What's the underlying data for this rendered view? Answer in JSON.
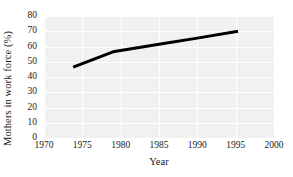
{
  "chart_data": {
    "type": "line",
    "title": "",
    "xlabel": "Year",
    "ylabel": "Mothers in work force (%)",
    "xlim": [
      1970,
      2000
    ],
    "ylim": [
      0,
      80
    ],
    "xticks": [
      1970,
      1975,
      1980,
      1985,
      1990,
      1995,
      2000
    ],
    "xtick_labels": [
      "1970",
      "1975",
      "1980",
      "1985",
      "1990",
      "1995",
      "2000"
    ],
    "yticks": [
      0,
      10,
      20,
      30,
      40,
      50,
      60,
      70,
      80
    ],
    "ytick_labels": [
      "0",
      "10",
      "20",
      "30",
      "40",
      "50",
      "60",
      "70",
      "80"
    ],
    "grid": true,
    "grid_color": "#ffffff",
    "plot_background": "#f1f1f1",
    "legend": null,
    "series": [
      {
        "name": "Mothers in work force",
        "color": "#000000",
        "line_width": 3,
        "x": [
          1973.8,
          1979.0,
          1985.0,
          1990.0,
          1995.3
        ],
        "values": [
          46.5,
          56.5,
          61.5,
          65.5,
          70.0
        ],
        "points": [
          {
            "x": 1973.8,
            "y": 46.5
          },
          {
            "x": 1979.0,
            "y": 56.5
          },
          {
            "x": 1985.0,
            "y": 61.5
          },
          {
            "x": 1990.0,
            "y": 65.5
          },
          {
            "x": 1995.3,
            "y": 70.0
          }
        ]
      }
    ]
  }
}
